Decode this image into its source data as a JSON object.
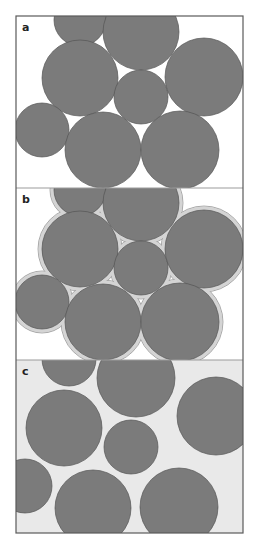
{
  "figure": {
    "colors": {
      "circle_fill": "#7b7b7b",
      "circle_stroke": "#555555",
      "halo_fill": "#d4d4d4",
      "halo_stroke": "#9a9a9a",
      "panel_a_bg": "#ffffff",
      "panel_b_bg": "#ffffff",
      "panel_c_bg": "#e9e9e9",
      "frame": "#5a5a5a",
      "separator": "#9c9c9c"
    },
    "frame": {
      "x": 16,
      "y": 16,
      "width": 227,
      "height": 517
    },
    "panels": [
      {
        "label": "a",
        "y": 16,
        "height": 172,
        "halo": false,
        "circles": [
          {
            "cx": 80,
            "cy": 20,
            "r": 26
          },
          {
            "cx": 141,
            "cy": 32,
            "r": 38
          },
          {
            "cx": 80,
            "cy": 78,
            "r": 38
          },
          {
            "cx": 141,
            "cy": 97,
            "r": 27
          },
          {
            "cx": 204,
            "cy": 77,
            "r": 39
          },
          {
            "cx": 42,
            "cy": 130,
            "r": 27
          },
          {
            "cx": 103,
            "cy": 150,
            "r": 38
          },
          {
            "cx": 180,
            "cy": 150,
            "r": 39
          }
        ]
      },
      {
        "label": "b",
        "y": 188,
        "height": 172,
        "halo": true,
        "halo_width": 4,
        "circles": [
          {
            "cx": 80,
            "cy": 190,
            "r": 26
          },
          {
            "cx": 141,
            "cy": 203,
            "r": 38
          },
          {
            "cx": 80,
            "cy": 249,
            "r": 38
          },
          {
            "cx": 141,
            "cy": 268,
            "r": 27
          },
          {
            "cx": 204,
            "cy": 249,
            "r": 39
          },
          {
            "cx": 42,
            "cy": 302,
            "r": 27
          },
          {
            "cx": 103,
            "cy": 322,
            "r": 38
          },
          {
            "cx": 180,
            "cy": 322,
            "r": 39
          }
        ]
      },
      {
        "label": "c",
        "y": 360,
        "height": 173,
        "halo": false,
        "circles": [
          {
            "cx": 69,
            "cy": 359,
            "r": 27
          },
          {
            "cx": 136,
            "cy": 378,
            "r": 39
          },
          {
            "cx": 64,
            "cy": 428,
            "r": 38
          },
          {
            "cx": 131,
            "cy": 447,
            "r": 27
          },
          {
            "cx": 216,
            "cy": 416,
            "r": 39
          },
          {
            "cx": 25,
            "cy": 486,
            "r": 27
          },
          {
            "cx": 93,
            "cy": 508,
            "r": 38
          },
          {
            "cx": 179,
            "cy": 507,
            "r": 39
          }
        ]
      }
    ]
  }
}
